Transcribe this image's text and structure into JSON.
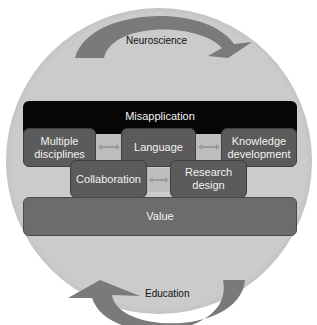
{
  "diagram": {
    "top_arrow": {
      "label": "Neuroscience",
      "direction": "clockwise-right"
    },
    "bottom_arrow": {
      "label": "Education",
      "direction": "clockwise-left"
    },
    "top_bar": {
      "label": "Misapplication"
    },
    "row1": [
      {
        "label": "Multiple disciplines"
      },
      {
        "label": "Language"
      },
      {
        "label": "Knowledge development"
      }
    ],
    "row2": [
      {
        "label": "Collaboration"
      },
      {
        "label": "Research design"
      }
    ],
    "bottom_bar": {
      "label": "Value"
    },
    "connectors": [
      {
        "from": "Multiple disciplines",
        "to": "Language",
        "icon": "double-arrow"
      },
      {
        "from": "Language",
        "to": "Knowledge development",
        "icon": "double-arrow"
      },
      {
        "from": "Collaboration",
        "to": "Research design",
        "icon": "double-arrow"
      }
    ],
    "colors": {
      "circle": "#cbcbcb",
      "arrows": "#7a7a7a",
      "top_bar": "#060606",
      "boxes": "#5b5b5b",
      "bottom_bar": "#6c6c6c",
      "connector": "#bdbdbd"
    }
  }
}
